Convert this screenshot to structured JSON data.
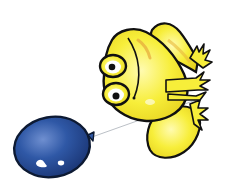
{
  "scene": {
    "description": "Cartoon yellow frog holding a blue balloon on a string",
    "background": "#ffffff",
    "subjects": [
      {
        "name": "frog",
        "color": "#f7ee3a",
        "shade": "#e8c93a",
        "outline": "#111111"
      },
      {
        "name": "balloon",
        "color": "#2f58a6",
        "dark": "#1c3a7a",
        "highlight": "#ffffff",
        "outline": "#0d1a33"
      },
      {
        "name": "string",
        "color": "#aab0b8"
      }
    ]
  }
}
